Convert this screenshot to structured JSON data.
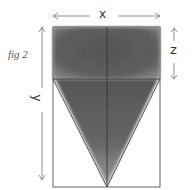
{
  "figure": {
    "caption": "fig 2",
    "labels": {
      "width": "x",
      "height": "y",
      "cap_depth": "z"
    },
    "colors": {
      "line": "#444444",
      "shade_dark": "#4a4a4a",
      "shade_mid": "#6e6e6e",
      "arrow": "#777777",
      "background": "#ffffff"
    },
    "geometry": {
      "rect": {
        "left": 53,
        "top": 27,
        "right": 160,
        "bottom": 187
      },
      "center_x": 107,
      "divider_y": 79,
      "apex": {
        "x": 107,
        "y": 187
      }
    }
  }
}
